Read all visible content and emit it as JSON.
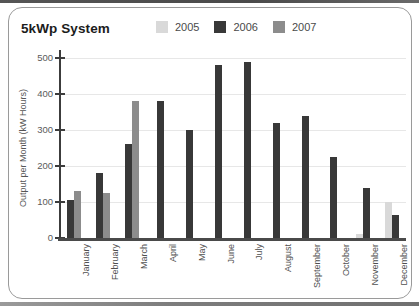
{
  "page": {
    "title": "5kWp System"
  },
  "chart_data": {
    "type": "bar",
    "title": "5kWp System",
    "xlabel": "",
    "ylabel": "Output per Month (kW Hours)",
    "ylim": [
      0,
      500
    ],
    "yticks": [
      0,
      100,
      200,
      300,
      400,
      500
    ],
    "grid": true,
    "legend_position": "top",
    "categories": [
      "January",
      "February",
      "March",
      "April",
      "May",
      "June",
      "July",
      "August",
      "September",
      "October",
      "November",
      "December"
    ],
    "series": [
      {
        "name": "2005",
        "color": "#d9d9d9",
        "values": [
          0,
          0,
          0,
          0,
          0,
          0,
          0,
          0,
          0,
          0,
          10,
          100
        ]
      },
      {
        "name": "2006",
        "color": "#383838",
        "values": [
          105,
          180,
          260,
          380,
          300,
          480,
          490,
          320,
          340,
          225,
          140,
          65
        ]
      },
      {
        "name": "2007",
        "color": "#8c8c8c",
        "values": [
          130,
          125,
          380,
          0,
          0,
          0,
          0,
          0,
          0,
          0,
          0,
          0
        ]
      }
    ]
  }
}
